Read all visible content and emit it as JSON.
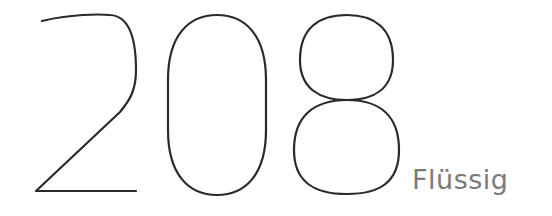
{
  "display": {
    "value": "208",
    "unit_label": "Flüssig",
    "stroke_color": "#2a2a2a",
    "label_color": "#7a7a7a"
  }
}
